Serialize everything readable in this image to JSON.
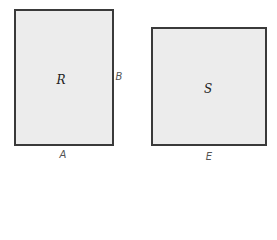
{
  "diagram": {
    "shapes": [
      {
        "id": "R",
        "label": "R",
        "kind": "rectangle",
        "side_labels": {
          "bottom": "A",
          "right": "B"
        }
      },
      {
        "id": "S",
        "label": "S",
        "kind": "square",
        "side_labels": {
          "bottom": "E"
        }
      }
    ],
    "colors": {
      "fill": "#ececec",
      "stroke": "#3a3a3a",
      "text": "#444444"
    }
  }
}
